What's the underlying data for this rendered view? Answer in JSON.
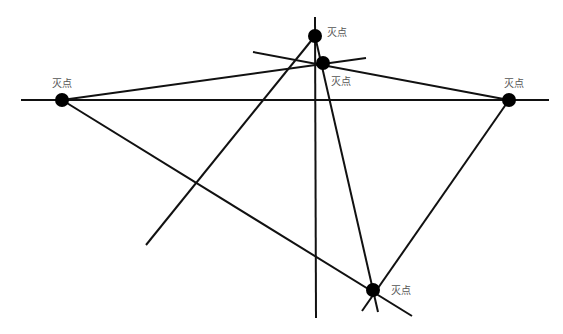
{
  "diagram": {
    "background": "#ffffff",
    "line_color": "#111111",
    "point_color": "#000000",
    "label_color": "#555555",
    "lines": [
      {
        "id": "horizon",
        "x1": 21,
        "y1": 100,
        "x2": 549,
        "y2": 100
      },
      {
        "id": "vertical",
        "x1": 315,
        "y1": 17,
        "x2": 316,
        "y2": 318
      },
      {
        "id": "left-to-mid",
        "x1": 62,
        "y1": 100,
        "x2": 366,
        "y2": 58
      },
      {
        "id": "left-to-bottom",
        "x1": 62,
        "y1": 100,
        "x2": 412,
        "y2": 316
      },
      {
        "id": "top-to-lowerleft",
        "x1": 315,
        "y1": 36,
        "x2": 146,
        "y2": 245
      },
      {
        "id": "top-to-bottom",
        "x1": 315,
        "y1": 36,
        "x2": 378,
        "y2": 312
      },
      {
        "id": "cross-through-mid",
        "x1": 253,
        "y1": 52,
        "x2": 509,
        "y2": 100
      },
      {
        "id": "right-to-bottom",
        "x1": 509,
        "y1": 100,
        "x2": 362,
        "y2": 311
      }
    ],
    "points": [
      {
        "id": "vp-top",
        "cx": 315,
        "cy": 36,
        "r": 7,
        "label": "灭点",
        "label_x": 327,
        "label_y": 27
      },
      {
        "id": "vp-mid",
        "cx": 323,
        "cy": 63,
        "r": 7,
        "label": "灭点",
        "label_x": 331,
        "label_y": 76
      },
      {
        "id": "vp-left",
        "cx": 62,
        "cy": 100,
        "r": 7,
        "label": "灭点",
        "label_x": 52,
        "label_y": 78
      },
      {
        "id": "vp-right",
        "cx": 509,
        "cy": 100,
        "r": 7,
        "label": "灭点",
        "label_x": 504,
        "label_y": 78
      },
      {
        "id": "vp-bottom",
        "cx": 373,
        "cy": 290,
        "r": 7,
        "label": "灭点",
        "label_x": 391,
        "label_y": 285
      }
    ]
  }
}
